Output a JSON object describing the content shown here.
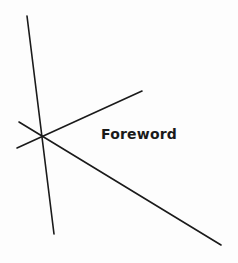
{
  "page": {
    "title": "Foreword",
    "background": "#fdfdfd",
    "ink_color": "#1a1a1a"
  },
  "decoration": {
    "lines": [
      {
        "name": "near-vertical-line",
        "x1": 27,
        "y1": 16,
        "x2": 54,
        "y2": 234
      },
      {
        "name": "rising-line",
        "x1": 17,
        "y1": 148,
        "x2": 142,
        "y2": 91
      },
      {
        "name": "falling-line",
        "x1": 19,
        "y1": 122,
        "x2": 221,
        "y2": 245
      }
    ],
    "stroke_width": 1.6
  }
}
